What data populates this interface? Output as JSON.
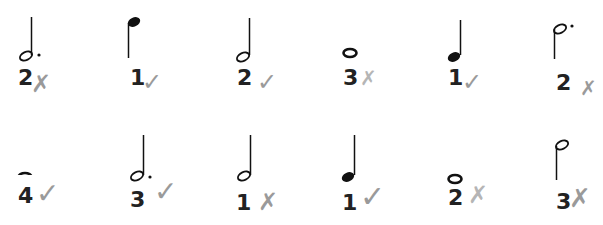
{
  "colors": {
    "ink": "#111111",
    "number": "#222222",
    "mark": "#9a9a9a",
    "background": "#ffffff"
  },
  "items": [
    {
      "note": "dotted-half-note",
      "stem": "up",
      "beats": "2",
      "mark": "cross",
      "glyph": "✗"
    },
    {
      "note": "quarter-note",
      "stem": "down",
      "beats": "1",
      "mark": "check",
      "glyph": "✓"
    },
    {
      "note": "half-note",
      "stem": "up",
      "beats": "2",
      "mark": "check",
      "glyph": "✓"
    },
    {
      "note": "whole-note",
      "stem": "none",
      "beats": "3",
      "mark": "cross",
      "glyph": "✗"
    },
    {
      "note": "quarter-note",
      "stem": "up",
      "beats": "1",
      "mark": "check",
      "glyph": "✓"
    },
    {
      "note": "dotted-half-note",
      "stem": "down",
      "beats": "2",
      "mark": "cross",
      "glyph": "✗"
    },
    {
      "note": "whole-note",
      "stem": "none",
      "beats": "4",
      "mark": "check",
      "glyph": "✓"
    },
    {
      "note": "dotted-half-note",
      "stem": "up",
      "beats": "3",
      "mark": "check",
      "glyph": "✓"
    },
    {
      "note": "half-note",
      "stem": "up",
      "beats": "1",
      "mark": "cross",
      "glyph": "✗"
    },
    {
      "note": "quarter-note",
      "stem": "up",
      "beats": "1",
      "mark": "check",
      "glyph": "✓"
    },
    {
      "note": "whole-note",
      "stem": "none",
      "beats": "2",
      "mark": "cross",
      "glyph": "✗"
    },
    {
      "note": "half-note",
      "stem": "down",
      "beats": "3",
      "mark": "cross",
      "glyph": "✗"
    }
  ]
}
